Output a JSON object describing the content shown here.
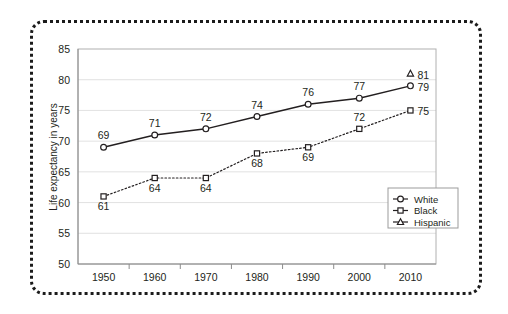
{
  "chart_data": {
    "type": "line",
    "title": "",
    "xlabel": "",
    "ylabel": "Life expectancy in years",
    "categories": [
      "1950",
      "1960",
      "1970",
      "1980",
      "1990",
      "2000",
      "2010"
    ],
    "ylim": [
      50,
      85
    ],
    "yticks": [
      "50",
      "55",
      "60",
      "65",
      "70",
      "75",
      "80",
      "85"
    ],
    "grid": true,
    "legend_position": "lower-right",
    "series": [
      {
        "name": "White",
        "marker": "circle",
        "linestyle": "solid",
        "values": [
          69,
          71,
          72,
          74,
          76,
          77,
          79
        ],
        "labels": [
          "69",
          "71",
          "72",
          "74",
          "76",
          "77",
          "79"
        ],
        "label_positions": [
          "above",
          "above",
          "above",
          "above",
          "above",
          "above",
          "right"
        ]
      },
      {
        "name": "Black",
        "marker": "square",
        "linestyle": "dotted",
        "values": [
          61,
          64,
          64,
          68,
          69,
          72,
          75
        ],
        "labels": [
          "61",
          "64",
          "64",
          "68",
          "69",
          "72",
          "75"
        ],
        "label_positions": [
          "below",
          "below",
          "below",
          "below",
          "below",
          "above",
          "right"
        ]
      },
      {
        "name": "Hispanic",
        "marker": "triangle",
        "linestyle": "none",
        "values": [
          null,
          null,
          null,
          null,
          null,
          null,
          81
        ],
        "labels": [
          "",
          "",
          "",
          "",
          "",
          "",
          "81"
        ],
        "label_positions": [
          "",
          "",
          "",
          "",
          "",
          "",
          "right"
        ]
      }
    ]
  },
  "legend": {
    "entries": [
      {
        "label": "White",
        "marker": "circle"
      },
      {
        "label": "Black",
        "marker": "square"
      },
      {
        "label": "Hispanic",
        "marker": "triangle"
      }
    ]
  },
  "colors": {
    "ink": "#231f20",
    "grid": "#d9d9d9",
    "axis": "#8c8c8c",
    "frame": "#1b1b1b",
    "background": "#ffffff"
  }
}
